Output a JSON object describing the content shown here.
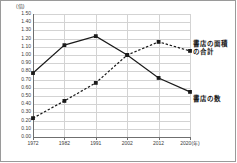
{
  "figure": {
    "y_unit_label": "(倍)",
    "x_unit_suffix": "(年)"
  },
  "annotations": {
    "area_label": "書店の面積\nの合計",
    "count_label": "書店の数"
  },
  "chart_data": {
    "type": "line",
    "title": "",
    "xlabel": "(年)",
    "ylabel": "(倍)",
    "categories": [
      "1972",
      "1982",
      "1991",
      "2002",
      "2012",
      "2020(年)"
    ],
    "x": [
      1972,
      1982,
      1991,
      2002,
      2012,
      2020
    ],
    "xlim": [
      1972,
      2020
    ],
    "ylim": [
      0.0,
      1.5
    ],
    "ytick_labels": [
      "1.50",
      "1.40",
      "1.30",
      "1.20",
      "1.10",
      "1.00",
      "0.90",
      "0.80",
      "0.70",
      "0.60",
      "0.50",
      "0.40",
      "0.30",
      "0.20",
      "0.10",
      "0.00"
    ],
    "yticks": [
      1.5,
      1.4,
      1.3,
      1.2,
      1.1,
      1.0,
      0.9,
      0.8,
      0.7,
      0.6,
      0.5,
      0.4,
      0.3,
      0.2,
      0.1,
      0.0
    ],
    "grid": true,
    "legend_position": "annotated-right",
    "series": [
      {
        "name": "書店の数",
        "style": "solid",
        "color": "#1a1a1a",
        "marker": "square",
        "values": [
          0.78,
          1.12,
          1.23,
          1.0,
          0.72,
          0.55
        ]
      },
      {
        "name": "書店の面積の合計",
        "style": "dashed",
        "color": "#1a1a1a",
        "marker": "square",
        "values": [
          0.23,
          0.44,
          0.66,
          1.0,
          1.16,
          1.05
        ]
      }
    ]
  }
}
